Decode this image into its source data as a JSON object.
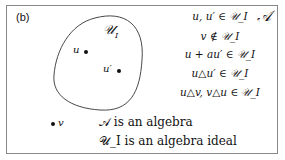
{
  "panel_label": "(b)",
  "universe_label": "𝒜",
  "set_label": "𝒰",
  "set_subscript": "I",
  "points": {
    "u": "u",
    "u_prime": "u′",
    "v": "v"
  },
  "relations": [
    "u, u′ ∈ 𝒰_I",
    "v ∉ 𝒰_I",
    "u + au′ ∈ 𝒰_I",
    "u△u′ ∈ 𝒰_I",
    "u△v, v△u ∈ 𝒰_I"
  ],
  "statements": [
    "𝒜 is an algebra",
    "𝒰_I is an algebra ideal"
  ]
}
